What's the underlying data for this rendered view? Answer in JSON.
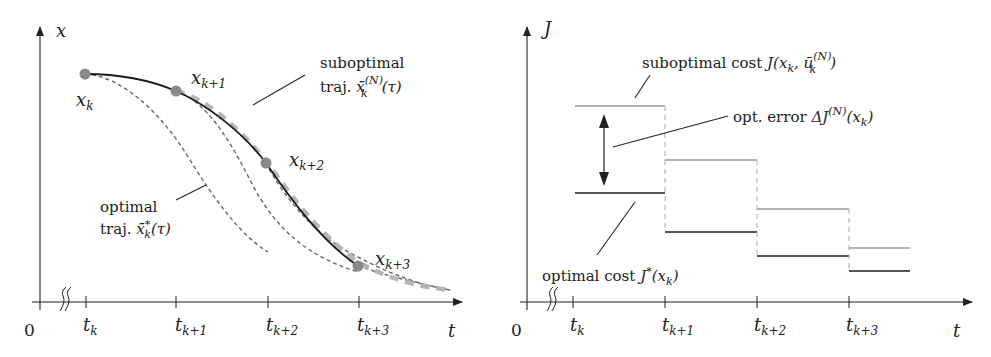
{
  "left_panel": {
    "y_axis_label": "x",
    "x_axis_label": "t",
    "origin_label": "0",
    "ticks": [
      {
        "main": "t",
        "sub": "k"
      },
      {
        "main": "t",
        "sub": "k+1"
      },
      {
        "main": "t",
        "sub": "k+2"
      },
      {
        "main": "t",
        "sub": "k+3"
      }
    ],
    "points": [
      {
        "main": "x",
        "sub": "k"
      },
      {
        "main": "x",
        "sub": "k+1"
      },
      {
        "main": "x",
        "sub": "k+2"
      },
      {
        "main": "x",
        "sub": "k+3"
      }
    ],
    "suboptimal_label": {
      "line1": "suboptimal",
      "line2_prefix": "traj. ",
      "symbol": "x̄",
      "sup": "(N)",
      "sub": "k",
      "suffix": "(τ)"
    },
    "optimal_label": {
      "line1": "optimal",
      "line2_prefix": "traj. ",
      "symbol": "x̄",
      "sup": "*",
      "sub": "k",
      "suffix": "(τ)"
    }
  },
  "right_panel": {
    "y_axis_label": "J",
    "x_axis_label": "t",
    "origin_label": "0",
    "ticks": [
      {
        "main": "t",
        "sub": "k"
      },
      {
        "main": "t",
        "sub": "k+1"
      },
      {
        "main": "t",
        "sub": "k+2"
      },
      {
        "main": "t",
        "sub": "k+3"
      }
    ],
    "suboptimal_cost_label": {
      "prefix": "suboptimal cost ",
      "expr": "J(x",
      "sub1": "k",
      "mid": ", ū",
      "sup2": "(N)",
      "sub2": "k",
      "suffix": ")"
    },
    "opt_error_label": {
      "prefix": "opt. error ",
      "expr": "ΔJ",
      "sup": "(N)",
      "arg_open": "(x",
      "sub": "k",
      "arg_close": ")"
    },
    "optimal_cost_label": {
      "prefix": "optimal cost ",
      "expr": "J",
      "sup": "*",
      "arg_open": "(x",
      "sub": "k",
      "arg_close": ")"
    },
    "step_levels": {
      "suboptimal": [
        106,
        160,
        209,
        248
      ],
      "optimal": [
        193,
        232,
        256,
        271
      ]
    }
  },
  "colors": {
    "axis": "#222222",
    "solid_curve": "#1a1a1a",
    "dashed_optimal": "#666666",
    "dashed_suboptimal": "#b5b5b5",
    "point_fill": "#8a8a8a",
    "sub_step": "#9a9a9a",
    "opt_step": "#555555"
  }
}
